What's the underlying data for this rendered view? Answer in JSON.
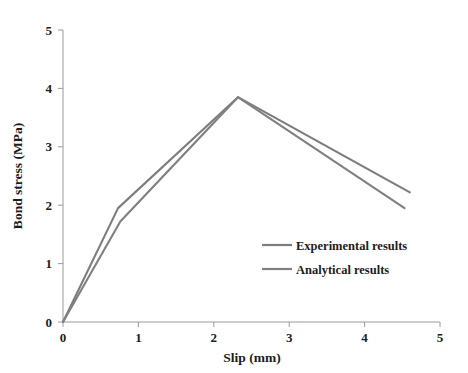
{
  "chart_data": {
    "type": "line",
    "title": "",
    "xlabel": "Slip  (mm)",
    "ylabel": "Bond stress (MPa)",
    "xlim": [
      0,
      5
    ],
    "ylim": [
      0,
      5
    ],
    "xticks": [
      "0",
      "1",
      "2",
      "3",
      "4",
      "5"
    ],
    "yticks": [
      "0",
      "1",
      "2",
      "3",
      "4",
      "5"
    ],
    "xtick_values": [
      0,
      1,
      2,
      3,
      4,
      5
    ],
    "ytick_values": [
      0,
      1,
      2,
      3,
      4,
      5
    ],
    "grid": false,
    "legend_position": "center-right",
    "series": [
      {
        "name": "Experimental results",
        "color": "#7d7d7d",
        "x": [
          0.0,
          0.73,
          2.32,
          4.6
        ],
        "y": [
          0.0,
          1.95,
          3.85,
          2.22
        ]
      },
      {
        "name": "Analytical results",
        "color": "#808080",
        "x": [
          0.0,
          0.76,
          2.32,
          4.53
        ],
        "y": [
          0.0,
          1.72,
          3.85,
          1.95
        ]
      }
    ],
    "annotations": {
      "peak_slip": 2.32,
      "peak_stress": 3.85
    }
  },
  "legend": {
    "items": [
      {
        "label": "Experimental results",
        "color": "#7d7d7d"
      },
      {
        "label": "Analytical results",
        "color": "#808080"
      }
    ]
  },
  "axes": {
    "x_title": "Slip  (mm)",
    "y_title": "Bond stress (MPa)"
  },
  "ticks": {
    "x": [
      "0",
      "1",
      "2",
      "3",
      "4",
      "5"
    ],
    "y": [
      "0",
      "1",
      "2",
      "3",
      "4",
      "5"
    ]
  },
  "colors": {
    "axis": "#9a9a9a",
    "text": "#1c1c1c",
    "background": "#ffffff",
    "series_1": "#7d7d7d",
    "series_2": "#808080"
  }
}
